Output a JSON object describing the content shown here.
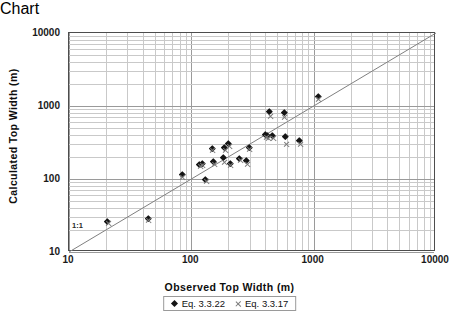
{
  "chart_data": {
    "type": "scatter",
    "title": "",
    "xlabel": "Observed Top Width (m)",
    "ylabel": "Calculated Top Width (m)",
    "xscale": "log",
    "yscale": "log",
    "xlim": [
      10,
      10000
    ],
    "ylim": [
      10,
      10000
    ],
    "xticks": [
      "10",
      "100",
      "1000",
      "10000"
    ],
    "yticks": [
      "10",
      "100",
      "1000",
      "10000"
    ],
    "grid": true,
    "minor_grid": true,
    "legend_position": "below-axis-title",
    "annotations": [
      {
        "text": "1:1",
        "x": 12,
        "y": 17,
        "note": "label for 1:1 reference line"
      }
    ],
    "reference_line": {
      "label": "1:1",
      "slope": 1,
      "from": [
        10,
        10
      ],
      "to": [
        10000,
        10000
      ]
    },
    "series": [
      {
        "name": "Eq. 3.3.22",
        "marker": "diamond",
        "color": "#141414",
        "points": [
          [
            21,
            26
          ],
          [
            45,
            28
          ],
          [
            85,
            113
          ],
          [
            118,
            155
          ],
          [
            124,
            160
          ],
          [
            133,
            96
          ],
          [
            150,
            260
          ],
          [
            155,
            168
          ],
          [
            185,
            192
          ],
          [
            190,
            262
          ],
          [
            205,
            300
          ],
          [
            210,
            158
          ],
          [
            250,
            190
          ],
          [
            285,
            178
          ],
          [
            300,
            268
          ],
          [
            410,
            400
          ],
          [
            425,
            390
          ],
          [
            440,
            820
          ],
          [
            470,
            385
          ],
          [
            580,
            790
          ],
          [
            600,
            380
          ],
          [
            780,
            325
          ],
          [
            1100,
            1320
          ]
        ]
      },
      {
        "name": "Eq. 3.3.17",
        "marker": "x",
        "color": "#7a7a7a",
        "points": [
          [
            21,
            25
          ],
          [
            45,
            27
          ],
          [
            85,
            105
          ],
          [
            118,
            150
          ],
          [
            124,
            152
          ],
          [
            133,
            94
          ],
          [
            150,
            250
          ],
          [
            155,
            160
          ],
          [
            185,
            170
          ],
          [
            190,
            250
          ],
          [
            205,
            275
          ],
          [
            210,
            155
          ],
          [
            250,
            180
          ],
          [
            285,
            160
          ],
          [
            300,
            255
          ],
          [
            410,
            372
          ],
          [
            425,
            360
          ],
          [
            440,
            730
          ],
          [
            470,
            360
          ],
          [
            580,
            690
          ],
          [
            600,
            295
          ],
          [
            780,
            300
          ],
          [
            1100,
            1230
          ]
        ]
      }
    ]
  },
  "axes": {
    "x_title": "Observed Top Width (m)",
    "y_title": "Calculated Top Width (m)",
    "x_tick_labels": [
      "10",
      "100",
      "1000",
      "10000"
    ],
    "y_tick_labels": [
      "10",
      "100",
      "1000",
      "10000"
    ]
  },
  "annotation": {
    "ratio_label": "1:1"
  },
  "legend": {
    "items": [
      {
        "label": "Eq. 3.3.22",
        "marker": "diamond"
      },
      {
        "label": "Eq. 3.3.17",
        "marker": "x"
      }
    ]
  },
  "caption": {
    "text": ""
  }
}
